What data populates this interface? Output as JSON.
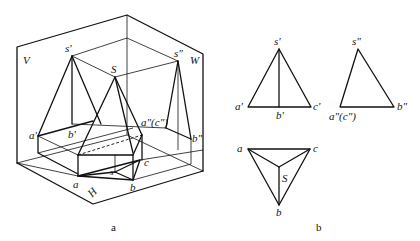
{
  "figure_a": {
    "caption": "a",
    "planes": {
      "V": "V",
      "W": "W",
      "H": "H"
    },
    "labels": {
      "s_prime": "s'",
      "s_dprime": "s\"",
      "S": "S",
      "a_prime": "a'",
      "b_prime": "b'",
      "ac_dprime": "a\"(c\")",
      "b_dprime": "b\"",
      "a": "a",
      "b": "b",
      "c": "c",
      "s": "s"
    }
  },
  "figure_b": {
    "caption": "b",
    "front_view": {
      "s": "s'",
      "a": "a'",
      "b": "b'",
      "c": "c'"
    },
    "side_view": {
      "s": "s\"",
      "ac": "a\"(c\")",
      "b": "b\""
    },
    "top_view": {
      "a": "a",
      "b": "b",
      "c": "c",
      "S": "S"
    }
  }
}
